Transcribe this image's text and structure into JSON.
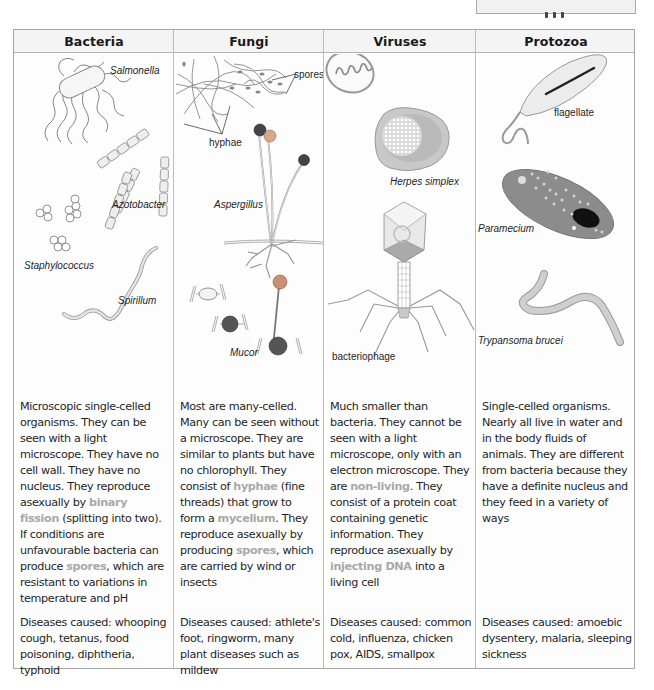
{
  "corner_box": {
    "text": ""
  },
  "table": {
    "columns": [
      {
        "header": "Bacteria",
        "labels": [
          "Salmonella",
          "Azotobacter",
          "Staphylococcus",
          "Spirillum"
        ],
        "description": [
          {
            "t": "Microscopic single-celled organisms. They can be seen with a light microscope. They have no cell wall. They have no nucleus. They reproduce asexually by "
          },
          {
            "t": "binary fission",
            "hl": true
          },
          {
            "t": " (splitting into two). If conditions are unfavourable bacteria can produce "
          },
          {
            "t": "spores",
            "hl": true
          },
          {
            "t": ", which are resistant to variations in temperature and pH"
          }
        ],
        "diseases": "Diseases caused: whooping cough, tetanus, food poisoning, diphtheria, typhoid"
      },
      {
        "header": "Fungi",
        "labels": [
          "spores",
          "hyphae",
          "Aspergillus",
          "Mucor"
        ],
        "description": [
          {
            "t": "Most are many-celled. Many can be seen without a microscope. They are similar to plants but have no chlorophyll. They consist of "
          },
          {
            "t": "hyphae",
            "hl": true
          },
          {
            "t": " (fine threads) that grow to form a "
          },
          {
            "t": "mycelium",
            "hl": true
          },
          {
            "t": ". They reproduce asexually by producing "
          },
          {
            "t": "spores",
            "hl": true
          },
          {
            "t": ", which are carried by wind or insects"
          }
        ],
        "diseases": "Diseases caused: athlete's foot, ringworm, many plant diseases such as mildew"
      },
      {
        "header": "Viruses",
        "labels": [
          "Herpes simplex",
          "bacteriophage"
        ],
        "description": [
          {
            "t": "Much smaller than bacteria. They cannot be seen with a light microscope, only with an electron microscope. They are "
          },
          {
            "t": "non-living",
            "hl": true
          },
          {
            "t": ". They consist of a protein coat containing genetic information. They reproduce asexually by "
          },
          {
            "t": "injecting DNA",
            "hl": true
          },
          {
            "t": " into a living cell"
          }
        ],
        "diseases": "Diseases caused: common cold, influenza, chicken pox, AIDS, smallpox"
      },
      {
        "header": "Protozoa",
        "labels": [
          "flagellate",
          "Paramecium",
          "Trypansoma brucei"
        ],
        "description": [
          {
            "t": "Single-celled organisms. Nearly all live in water and in the body fluids of animals. They are different from bacteria because they have a definite nucleus and they feed in a variety of ways"
          }
        ],
        "diseases": "Diseases caused: amoebic dysentery, malaria, sleeping sickness"
      }
    ]
  },
  "colors": {
    "highlight": "#a8a8a8",
    "border": "#a6a6a6",
    "header_bg": "#f4f4f4",
    "text": "#1f1f1f"
  }
}
